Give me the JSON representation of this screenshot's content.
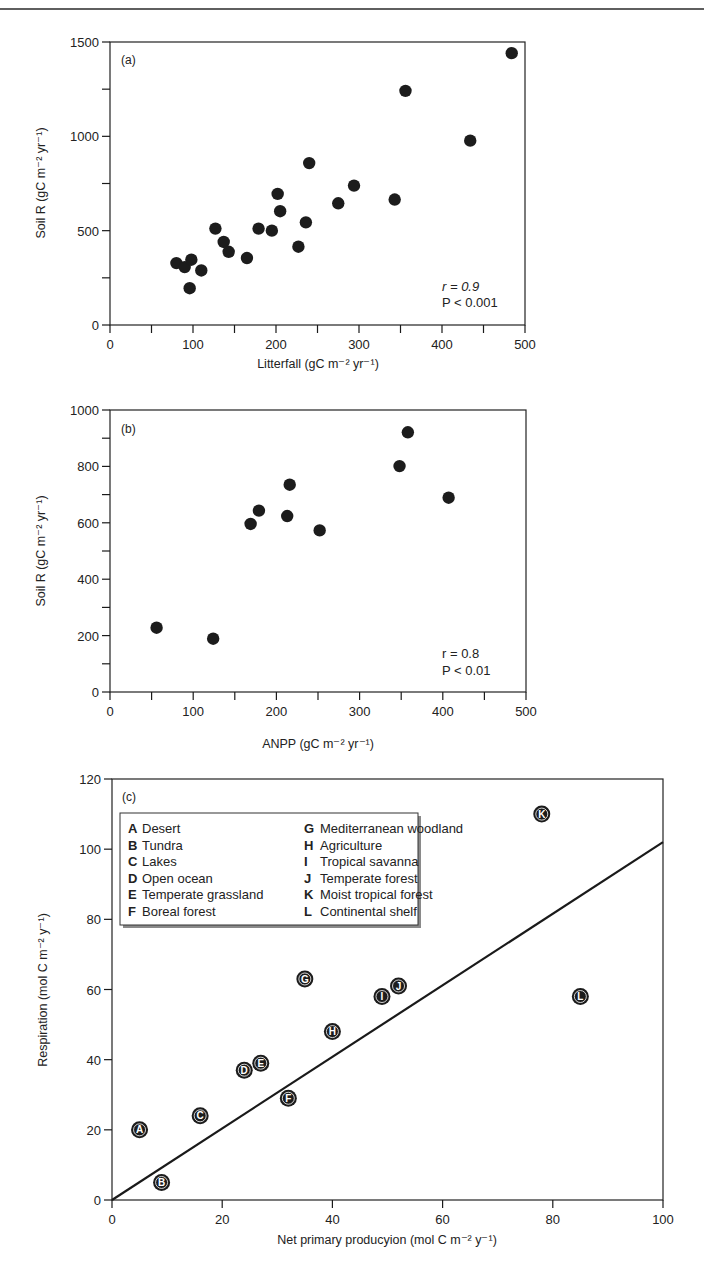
{
  "figure": {
    "top_rule": true
  },
  "chart_data": [
    {
      "id": "a",
      "type": "scatter",
      "panel_label": "(a)",
      "title": "",
      "xlabel": "Litterfall (gC m⁻² yr⁻¹)",
      "ylabel": "Soil R (gC m⁻² yr⁻¹)",
      "xlim": [
        0,
        500
      ],
      "ylim": [
        0,
        1500
      ],
      "xticks": [
        0,
        100,
        200,
        300,
        400,
        500
      ],
      "xminor": [
        50,
        150,
        250,
        350,
        450
      ],
      "yticks": [
        0,
        500,
        1000,
        1500
      ],
      "yminor": [
        250,
        750,
        1250
      ],
      "grid": false,
      "annotations": [
        "r = 0.9",
        "P < 0.001"
      ],
      "points": [
        [
          80,
          328
        ],
        [
          90,
          307
        ],
        [
          98,
          346
        ],
        [
          96,
          195
        ],
        [
          110,
          289
        ],
        [
          127,
          511
        ],
        [
          137,
          440
        ],
        [
          143,
          388
        ],
        [
          165,
          355
        ],
        [
          179,
          511
        ],
        [
          195,
          500
        ],
        [
          202,
          695
        ],
        [
          205,
          603
        ],
        [
          227,
          415
        ],
        [
          236,
          544
        ],
        [
          240,
          858
        ],
        [
          275,
          645
        ],
        [
          294,
          739
        ],
        [
          343,
          665
        ],
        [
          356,
          1241
        ],
        [
          434,
          977
        ],
        [
          484,
          1441
        ]
      ]
    },
    {
      "id": "b",
      "type": "scatter",
      "panel_label": "(b)",
      "title": "",
      "xlabel": "ANPP (gC m⁻² yr⁻¹)",
      "ylabel": "Soil R (gC m⁻² yr⁻¹)",
      "xlim": [
        0,
        500
      ],
      "ylim": [
        0,
        1000
      ],
      "xticks": [
        0,
        100,
        200,
        300,
        400,
        500
      ],
      "xminor": [
        50,
        150,
        250,
        350,
        450
      ],
      "yticks": [
        0,
        200,
        400,
        600,
        800,
        1000
      ],
      "yminor": [
        100,
        300,
        500,
        700,
        900
      ],
      "grid": false,
      "annotations": [
        "r = 0.8",
        "P < 0.01"
      ],
      "points": [
        [
          56,
          228
        ],
        [
          124,
          189
        ],
        [
          169,
          596
        ],
        [
          179,
          643
        ],
        [
          213,
          624
        ],
        [
          216,
          735
        ],
        [
          252,
          573
        ],
        [
          348,
          801
        ],
        [
          358,
          921
        ],
        [
          407,
          689
        ]
      ]
    },
    {
      "id": "c",
      "type": "scatter",
      "panel_label": "(c)",
      "title": "",
      "xlabel": "Net primary producyion (mol C m⁻² y⁻¹)",
      "ylabel": "Respiration (mol C m⁻² y⁻¹)",
      "xlim": [
        0,
        100
      ],
      "ylim": [
        0,
        120
      ],
      "xticks": [
        0,
        20,
        40,
        60,
        80,
        100
      ],
      "yticks": [
        0,
        20,
        40,
        60,
        80,
        100,
        120
      ],
      "grid": false,
      "legend_position": "upper-left",
      "fit_line": {
        "x": [
          0,
          100
        ],
        "y": [
          0,
          102
        ]
      },
      "legend": [
        {
          "key": "A",
          "label": "Desert"
        },
        {
          "key": "B",
          "label": "Tundra"
        },
        {
          "key": "C",
          "label": "Lakes"
        },
        {
          "key": "D",
          "label": "Open ocean"
        },
        {
          "key": "E",
          "label": "Temperate grassland"
        },
        {
          "key": "F",
          "label": "Boreal forest"
        },
        {
          "key": "G",
          "label": "Mediterranean woodland"
        },
        {
          "key": "H",
          "label": "Agriculture"
        },
        {
          "key": "I",
          "label": "Tropical savanna"
        },
        {
          "key": "J",
          "label": "Temperate forest"
        },
        {
          "key": "K",
          "label": "Moist tropical forest"
        },
        {
          "key": "L",
          "label": "Continental shelf"
        }
      ],
      "points": [
        {
          "key": "A",
          "x": 5,
          "y": 20
        },
        {
          "key": "B",
          "x": 9,
          "y": 5
        },
        {
          "key": "C",
          "x": 16,
          "y": 24
        },
        {
          "key": "D",
          "x": 24,
          "y": 37
        },
        {
          "key": "E",
          "x": 27,
          "y": 39
        },
        {
          "key": "F",
          "x": 32,
          "y": 29
        },
        {
          "key": "G",
          "x": 35,
          "y": 63
        },
        {
          "key": "H",
          "x": 40,
          "y": 48
        },
        {
          "key": "I",
          "x": 49,
          "y": 58
        },
        {
          "key": "J",
          "x": 52,
          "y": 61
        },
        {
          "key": "K",
          "x": 78,
          "y": 110
        },
        {
          "key": "L",
          "x": 85,
          "y": 58
        }
      ]
    }
  ],
  "colors": {
    "ink": "#1a1a1a",
    "marker": "#1c1c1c",
    "background": "#ffffff",
    "legend_shadow": "#8a8a8a"
  }
}
